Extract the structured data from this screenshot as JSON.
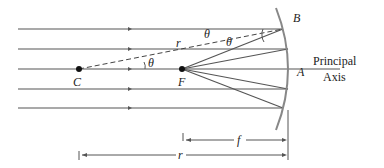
{
  "diagram": {
    "labels": {
      "B": "B",
      "A": "A",
      "C": "C",
      "F": "F",
      "r_radius": "r",
      "theta1": "θ",
      "theta2": "θ",
      "theta3": "θ",
      "principal": "Principal",
      "axis": "Axis",
      "f_dim": "f",
      "r_dim": "r"
    },
    "colors": {
      "ray": "#555555",
      "mirror": "#777777",
      "dashed": "#444444"
    }
  }
}
